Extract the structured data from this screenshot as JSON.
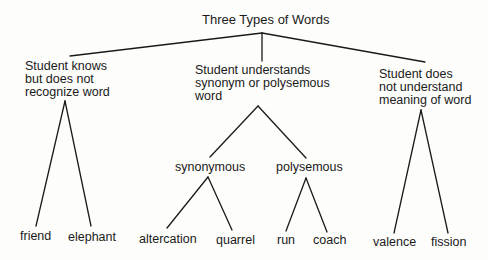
{
  "diagram": {
    "title": "Three Types of Words",
    "categories": [
      {
        "id": "knows-not-recognize",
        "label_lines": [
          "Student knows",
          "but does not",
          "recognize word"
        ],
        "examples": [
          "friend",
          "elephant"
        ]
      },
      {
        "id": "understands-synonym-polysemous",
        "label_lines": [
          "Student understands",
          "synonym or polysemous",
          "word"
        ],
        "subtypes": [
          {
            "label": "synonymous",
            "examples": [
              "altercation",
              "quarrel"
            ]
          },
          {
            "label": "polysemous",
            "examples": [
              "run",
              "coach"
            ]
          }
        ]
      },
      {
        "id": "does-not-understand",
        "label_lines": [
          "Student does",
          "not understand",
          "meaning of word"
        ],
        "examples": [
          "valence",
          "fission"
        ]
      }
    ],
    "colors": {
      "background": "#fdfdfb",
      "ink": "#1a1a1a"
    }
  }
}
